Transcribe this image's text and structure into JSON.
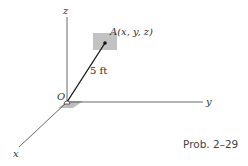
{
  "diagram": {
    "origin_label": "O",
    "point_label": "A(x, y, z)",
    "length_label": "5 ft",
    "axes": {
      "x": "x",
      "y": "y",
      "z": "z"
    },
    "caption": "Prob. 2–29",
    "colors": {
      "line": "#222222",
      "plate": "#bdbdbd",
      "text": "#333333"
    }
  }
}
